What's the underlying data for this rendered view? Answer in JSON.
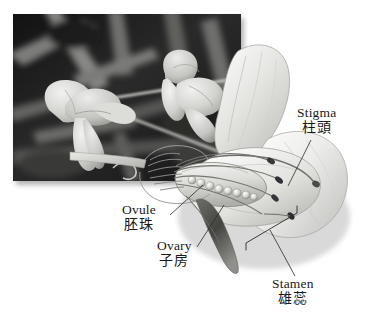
{
  "figure": {
    "type": "botanical-diagram",
    "background_color": "#ffffff"
  },
  "photo": {
    "name": "pea-flower-photograph",
    "style": "grayscale",
    "alt_description": "Black and white photograph of pea flowers on a vine against a dark leafy background",
    "border_color": "#ffffff",
    "shadow": true
  },
  "illustration": {
    "name": "flower-cross-section",
    "style": "grayscale pencil rendering",
    "parts": {
      "standard_petal": "upper banner petal",
      "wing_petal": "side petal",
      "keel_petal": "lower enclosing petal",
      "ovary": "elongated pod-like chamber",
      "ovules": "row of spherical ovules inside the ovary",
      "stamens": "curved filaments tipped with dark anthers",
      "stigma": "tip of the style",
      "sepal": "dark calyx below the ovary"
    },
    "ovule_count": 8,
    "anther_count": 4,
    "ink_color": "#3a3a3a"
  },
  "labels": [
    {
      "id": "stigma",
      "en": "Stigma",
      "zh": "柱頭"
    },
    {
      "id": "ovule",
      "en": "Ovule",
      "zh": "胚珠"
    },
    {
      "id": "ovary",
      "en": "Ovary",
      "zh": "子房"
    },
    {
      "id": "stamen",
      "en": "Stamen",
      "zh": "雄蕊"
    }
  ],
  "leader_lines": {
    "color": "#2b2b2b",
    "width": 0.8,
    "count": 4,
    "bracket_present": true
  }
}
